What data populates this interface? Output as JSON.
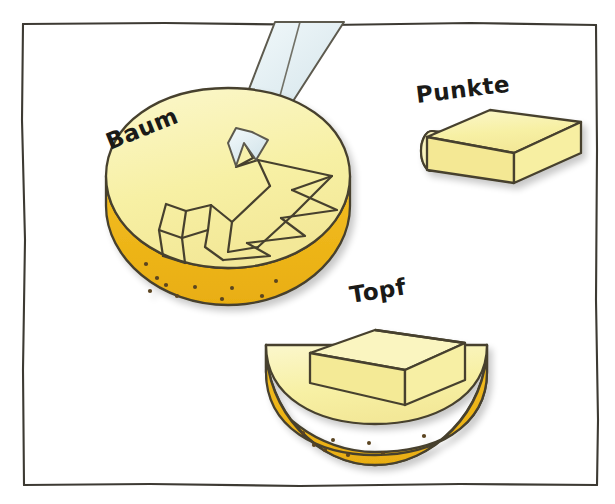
{
  "illustration": {
    "title": "Cheese wheel cut diagram",
    "background_color": "#ffffff",
    "frame": {
      "name": "panel-border",
      "stroke_color": "#3d3a33",
      "x": 22,
      "y": 23,
      "width": 575,
      "height": 462
    },
    "palette": {
      "cheese_top": "#f7f0a4",
      "cheese_top_light": "#faf6c4",
      "cheese_rind": "#f0b81c",
      "cheese_rind_shadow": "#e3a915",
      "cheese_cut_face": "#f5eda0",
      "outline": "#46412e",
      "knife_blade": "#dbe9ee",
      "knife_blade_light": "#eef6f9",
      "dot": "#5a4420",
      "label_text": "#1a1a18"
    },
    "labels": [
      {
        "name": "label-baum",
        "text": "Baum",
        "x": 110,
        "y": 150,
        "rotation": -22,
        "font_size": 23
      },
      {
        "name": "label-punkte",
        "text": "Punkte",
        "x": 417,
        "y": 103,
        "rotation": -7,
        "font_size": 23
      },
      {
        "name": "label-topf",
        "text": "Topf",
        "x": 351,
        "y": 303,
        "rotation": -9,
        "font_size": 23
      }
    ],
    "objects": [
      {
        "name": "cheese-wheel-baum",
        "label": "Baum",
        "description": "Round cheese wheel with zigzag arrow shaped cut on top surface",
        "center_x": 228,
        "center_y": 215,
        "radius_x": 122,
        "radius_y": 95,
        "dot_count": 10
      },
      {
        "name": "cheese-block-punkte",
        "label": "Punkte",
        "description": "Rectangular cheese block with a cylinder attached at its left face",
        "center_x": 495,
        "center_y": 140
      },
      {
        "name": "cheese-half-topf",
        "label": "Topf",
        "description": "Half cheese wheel with rectangular block standing inside the cut",
        "center_x": 375,
        "center_y": 385,
        "dot_count": 8
      },
      {
        "name": "knife",
        "label": "",
        "description": "Pale blue knife blade descending into the Baum wheel",
        "tip_x": 245,
        "tip_y": 165
      }
    ]
  }
}
